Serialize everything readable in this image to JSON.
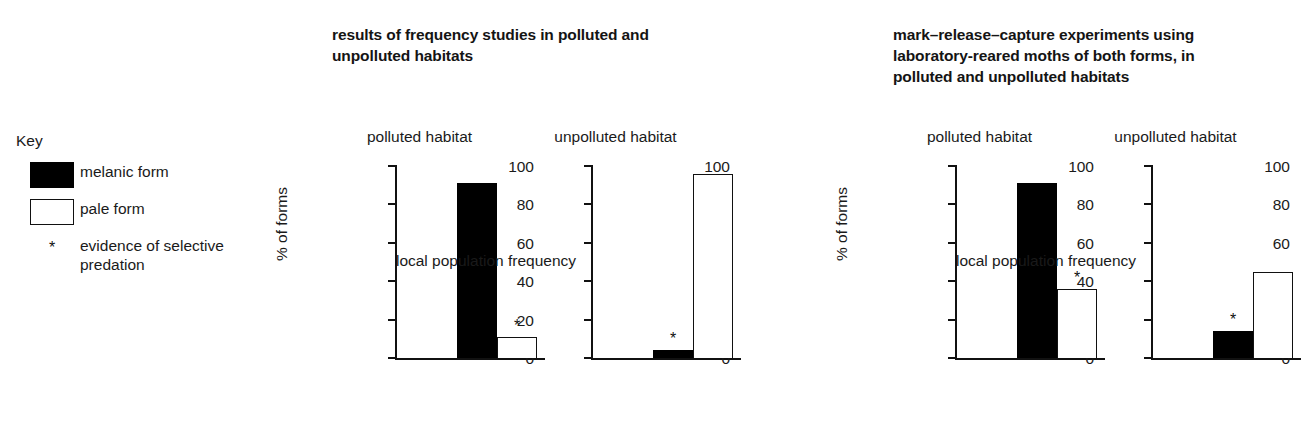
{
  "key": {
    "heading": "Key",
    "items": [
      {
        "swatch": "filled-square-icon",
        "label": "melanic form"
      },
      {
        "swatch": "hollow-square-icon",
        "label": "pale form"
      },
      {
        "swatch": "asterisk-icon",
        "glyph": "*",
        "label": "evidence of selective predation"
      }
    ]
  },
  "panels": [
    {
      "title": "results of frequency studies in polluted and unpolluted habitats",
      "xlabel": "local population frequency",
      "charts": [
        {
          "subtitle": "polluted habitat"
        },
        {
          "subtitle": "unpolluted habitat"
        }
      ]
    },
    {
      "title": "mark–release–capture experiments using laboratory-reared moths of both forms, in polluted and unpolluted habitats",
      "xlabel": "local population frequency",
      "charts": [
        {
          "subtitle": "polluted habitat"
        },
        {
          "subtitle": "unpolluted habitat"
        }
      ]
    }
  ],
  "axis": {
    "ticks": [
      "100",
      "80",
      "60",
      "40",
      "20",
      "0"
    ],
    "ylabel": "% of forms"
  },
  "colors": {
    "melanic": "#000000",
    "pale": "#ffffff",
    "outline": "#111111",
    "text": "#1a1a1a",
    "background": "#ffffff"
  },
  "chart_data": [
    {
      "type": "bar",
      "title": "results of frequency studies in polluted and unpolluted habitats",
      "subtitle": "polluted habitat",
      "panel": 1,
      "categories": [
        "melanic form",
        "pale form"
      ],
      "values": [
        91,
        11
      ],
      "annotations": [
        {
          "category": "pale form",
          "symbol": "*",
          "meaning": "evidence of selective predation"
        }
      ],
      "xlabel": "local population frequency",
      "ylabel": "% of forms",
      "ylim": [
        0,
        100
      ],
      "yticks": [
        0,
        20,
        40,
        60,
        80,
        100
      ],
      "grid": false,
      "legend": "external key, left"
    },
    {
      "type": "bar",
      "title": "results of frequency studies in polluted and unpolluted habitats",
      "subtitle": "unpolluted habitat",
      "panel": 1,
      "categories": [
        "melanic form",
        "pale form"
      ],
      "values": [
        4,
        96
      ],
      "annotations": [
        {
          "category": "melanic form",
          "symbol": "*",
          "meaning": "evidence of selective predation"
        }
      ],
      "xlabel": "local population frequency",
      "ylabel": "% of forms",
      "ylim": [
        0,
        100
      ],
      "yticks": [
        0,
        20,
        40,
        60,
        80,
        100
      ],
      "grid": false,
      "legend": "external key, left"
    },
    {
      "type": "bar",
      "title": "mark–release–capture experiments using laboratory-reared moths of both forms, in polluted and unpolluted habitats",
      "subtitle": "polluted habitat",
      "panel": 2,
      "categories": [
        "melanic form",
        "pale form"
      ],
      "values": [
        91,
        36
      ],
      "annotations": [
        {
          "category": "pale form",
          "symbol": "*",
          "meaning": "evidence of selective predation"
        }
      ],
      "xlabel": "local population frequency",
      "ylabel": "% of forms",
      "ylim": [
        0,
        100
      ],
      "yticks": [
        0,
        20,
        40,
        60,
        80,
        100
      ],
      "grid": false,
      "legend": "external key, left"
    },
    {
      "type": "bar",
      "title": "mark–release–capture experiments using laboratory-reared moths of both forms, in polluted and unpolluted habitats",
      "subtitle": "unpolluted habitat",
      "panel": 2,
      "categories": [
        "melanic form",
        "pale form"
      ],
      "values": [
        14,
        45
      ],
      "annotations": [
        {
          "category": "melanic form",
          "symbol": "*",
          "meaning": "evidence of selective predation"
        }
      ],
      "xlabel": "local population frequency",
      "ylabel": "% of forms",
      "ylim": [
        0,
        100
      ],
      "yticks": [
        0,
        20,
        40,
        60,
        80,
        100
      ],
      "grid": false,
      "legend": "external key, left"
    }
  ]
}
